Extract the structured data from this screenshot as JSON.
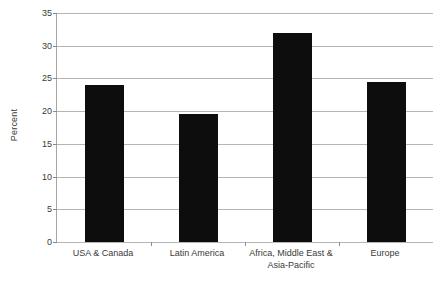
{
  "chart_data": {
    "type": "bar",
    "title": "",
    "subtitle": "",
    "xlabel": "",
    "ylabel": "Percent",
    "ylim": [
      0,
      35
    ],
    "ytick_step": 5,
    "grid": true,
    "legend": false,
    "orientation": "vertical",
    "bar_color": "#0d0d0d",
    "categories": [
      "USA & Canada",
      "Latin America",
      "Africa, Middle East & Asia-Pacific",
      "Europe"
    ],
    "category_lines": [
      [
        "USA & Canada"
      ],
      [
        "Latin America"
      ],
      [
        "Africa, Middle East &",
        "Asia-Pacific"
      ],
      [
        "Europe"
      ]
    ],
    "values": [
      24.0,
      19.6,
      32.0,
      24.5
    ],
    "ytick_labels": [
      "0",
      "5",
      "10",
      "15",
      "20",
      "25",
      "30",
      "35"
    ],
    "ytick_values": [
      0,
      5,
      10,
      15,
      20,
      25,
      30,
      35
    ]
  },
  "axes": {
    "y_title": "Percent"
  },
  "colors": {
    "bar": "#0d0d0d",
    "gridline": "#b5b5b5",
    "axis": "#a6a6a6",
    "text": "#3a3a3a",
    "background": "#ffffff"
  }
}
